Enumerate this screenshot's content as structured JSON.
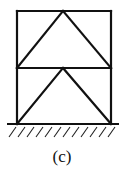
{
  "diagram": {
    "type": "two-story braced frame (structural truss)",
    "label": "(c)",
    "frame": {
      "left_x": 17,
      "right_x": 111,
      "top_y": 11,
      "middle_y": 68,
      "base_y": 124,
      "apex_x": 63
    },
    "members": [
      {
        "name": "left-column",
        "from": [
          17,
          11
        ],
        "to": [
          17,
          124
        ]
      },
      {
        "name": "right-column",
        "from": [
          111,
          11
        ],
        "to": [
          111,
          124
        ]
      },
      {
        "name": "top-beam",
        "from": [
          17,
          11
        ],
        "to": [
          111,
          11
        ]
      },
      {
        "name": "middle-beam",
        "from": [
          17,
          68
        ],
        "to": [
          111,
          68
        ]
      },
      {
        "name": "upper-left-brace",
        "from": [
          17,
          68
        ],
        "to": [
          63,
          11
        ]
      },
      {
        "name": "upper-right-brace",
        "from": [
          63,
          11
        ],
        "to": [
          111,
          68
        ]
      },
      {
        "name": "lower-left-brace",
        "from": [
          17,
          124
        ],
        "to": [
          63,
          68
        ]
      },
      {
        "name": "lower-right-brace",
        "from": [
          63,
          68
        ],
        "to": [
          111,
          124
        ]
      }
    ],
    "ground": {
      "y": 124,
      "x_start": 7,
      "x_end": 119,
      "hatch_count": 12
    },
    "color": "#111111"
  }
}
